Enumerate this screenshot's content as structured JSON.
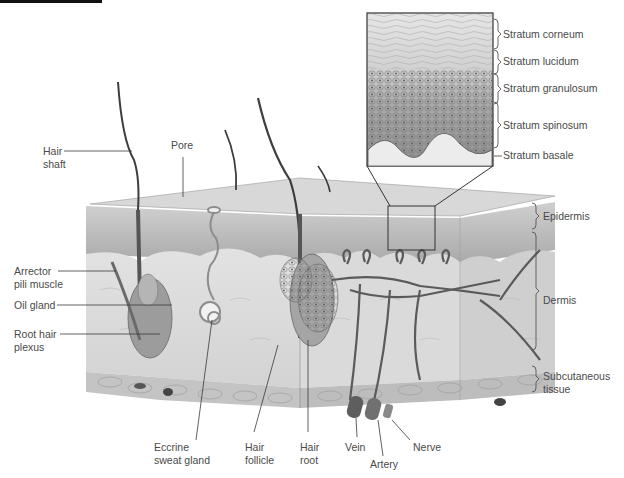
{
  "figure": {
    "inset_labels": [
      {
        "id": "stratum-corneum",
        "text": "Stratum corneum"
      },
      {
        "id": "stratum-lucidum",
        "text": "Stratum lucidum"
      },
      {
        "id": "stratum-granulosum",
        "text": "Stratum granulosum"
      },
      {
        "id": "stratum-spinosum",
        "text": "Stratum spinosum"
      },
      {
        "id": "stratum-basale",
        "text": "Stratum basale"
      }
    ],
    "layer_labels": {
      "epidermis": "Epidermis",
      "dermis": "Dermis",
      "subcutaneous_1": "Subcutaneous",
      "subcutaneous_2": "tissue"
    },
    "left_labels": {
      "hair_shaft_1": "Hair",
      "hair_shaft_2": "shaft",
      "pore": "Pore",
      "arrector_1": "Arrector",
      "arrector_2": "pili muscle",
      "oil_gland": "Oil gland",
      "root_plexus_1": "Root hair",
      "root_plexus_2": "plexus"
    },
    "bottom_labels": {
      "eccrine_1": "Eccrine",
      "eccrine_2": "sweat gland",
      "follicle_1": "Hair",
      "follicle_2": "follicle",
      "root_1": "Hair",
      "root_2": "root",
      "vein": "Vein",
      "artery": "Artery",
      "nerve": "Nerve"
    },
    "colors": {
      "line": "#3a3a3a",
      "text": "#4a4a4a",
      "epidermis": "#b9b9b9",
      "dermis": "#dcdcdc",
      "subcutaneous": "#c9c9c9",
      "vessel": "#5a5a5a"
    }
  }
}
